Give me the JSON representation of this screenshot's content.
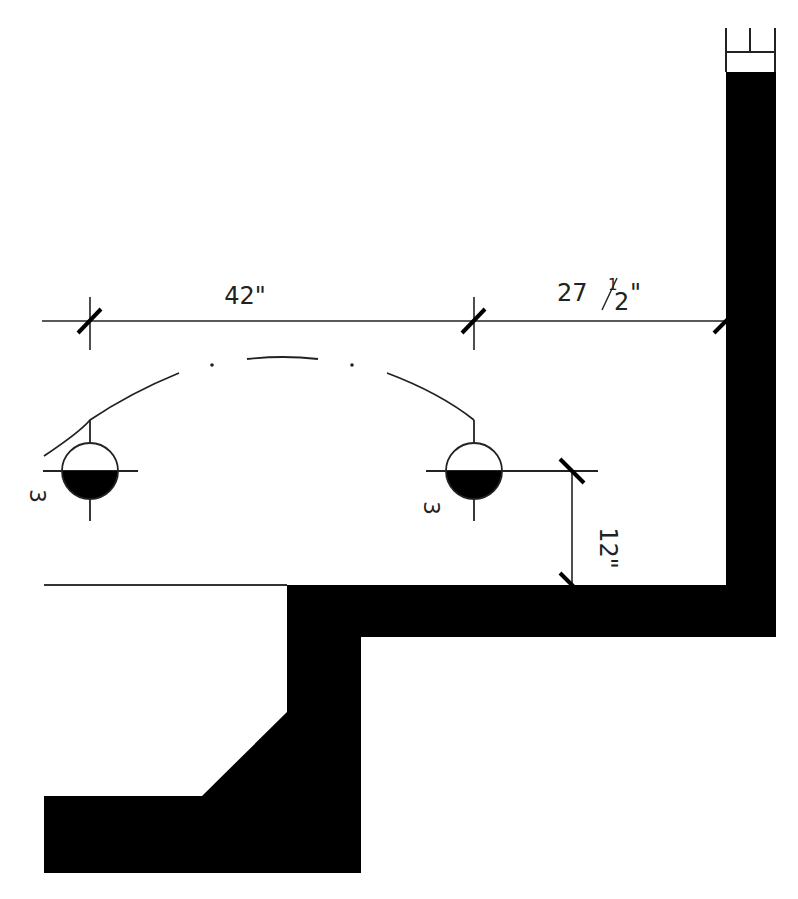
{
  "drawing": {
    "type": "architectural-floor-plan-detail",
    "colors": {
      "background": "#ffffff",
      "wall": "#000000",
      "line": "#222222"
    },
    "dimensions": {
      "fixture_spacing": {
        "whole": "42",
        "unit": "\""
      },
      "fixture_to_wall": {
        "whole": "27",
        "num": "1",
        "den": "2",
        "unit": "\""
      },
      "fixture_to_counter": {
        "whole": "12",
        "unit": "\""
      }
    },
    "fixtures": [
      {
        "id": "left-fixture",
        "label": "3"
      },
      {
        "id": "right-fixture",
        "label": "3"
      }
    ]
  }
}
